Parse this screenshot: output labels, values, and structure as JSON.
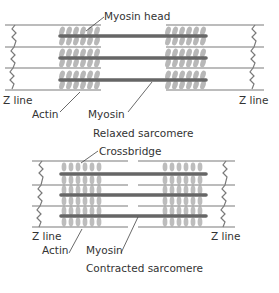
{
  "relaxed": {
    "labels": {
      "myosin_head": "Myosin head",
      "z_line_left": "Z line",
      "z_line_right": "Z line",
      "actin": "Actin",
      "myosin": "Myosin"
    },
    "caption": "Relaxed sarcomere"
  },
  "contracted": {
    "labels": {
      "crossbridge": "Crossbridge",
      "z_line_left": "Z line",
      "z_line_right": "Z line",
      "actin": "Actin",
      "myosin": "Myosin"
    },
    "caption": "Contracted sarcomere"
  },
  "colors": {
    "thin_line": "#7a7a7a",
    "myosin_bar": "#666666",
    "head": "#b5b5b5",
    "text": "#333333"
  }
}
